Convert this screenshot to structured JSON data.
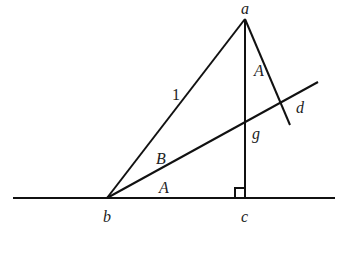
{
  "diagram": {
    "points": {
      "a": {
        "label": "a",
        "x": 245,
        "y": 19,
        "lx": 241,
        "ly": 14
      },
      "b": {
        "label": "b",
        "x": 107,
        "y": 198,
        "lx": 103,
        "ly": 222
      },
      "c": {
        "label": "c",
        "x": 245,
        "y": 198,
        "lx": 241,
        "ly": 222
      },
      "g": {
        "label": "g",
        "x": 245,
        "y": 120,
        "lx": 252,
        "ly": 139
      },
      "d": {
        "label": "d",
        "x": 282,
        "y": 102,
        "lx": 296,
        "ly": 113
      }
    },
    "segments": [
      {
        "name": "baseline",
        "x1": 13,
        "y1": 198,
        "x2": 335,
        "y2": 198
      },
      {
        "name": "hypotenuse-ab",
        "x1": 107,
        "y1": 198,
        "x2": 245,
        "y2": 19
      },
      {
        "name": "altitude-ac",
        "x1": 245,
        "y1": 19,
        "x2": 245,
        "y2": 198
      },
      {
        "name": "line-bd",
        "x1": 107,
        "y1": 198,
        "x2": 318,
        "y2": 82
      },
      {
        "name": "segment-ad",
        "x1": 245,
        "y1": 19,
        "x2": 290,
        "y2": 125
      }
    ],
    "right_angle": {
      "x": 235,
      "y": 188,
      "size": 10
    },
    "labels": {
      "side_length": {
        "text": "1",
        "x": 172,
        "y": 100
      },
      "angle_A_top": {
        "text": "A",
        "x": 254,
        "y": 76
      },
      "angle_B": {
        "text": "B",
        "x": 156,
        "y": 164
      },
      "angle_A_bottom": {
        "text": "A",
        "x": 159,
        "y": 193
      }
    }
  }
}
